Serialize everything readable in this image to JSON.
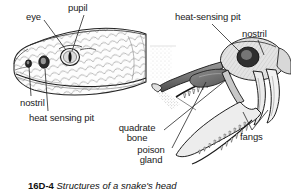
{
  "figure": {
    "caption_number": "16D-4",
    "caption_text": "Structures of a snake's head",
    "background_color": "#ffffff",
    "ink_color": "#1a1a1a"
  },
  "labels": {
    "eye": "eye",
    "pupil": "pupil",
    "nostril_left": "nostril",
    "heat_sensing_pit_left": "heat sensing pit",
    "heat_sensing_pit_right": "heat-sensing pit",
    "nostril_right": "nostril",
    "fangs": "fangs",
    "quadrate_bone": "quadrate bone",
    "poison_gland": "poison gland"
  },
  "illustrations": {
    "left": {
      "name": "snake-head-external-view",
      "description": "line drawing of a snake head in left profile showing scales"
    },
    "right": {
      "name": "snake-skull-open-jaws",
      "description": "shaded drawing of a viper skull facing right with jaws open showing fangs and teeth"
    }
  }
}
